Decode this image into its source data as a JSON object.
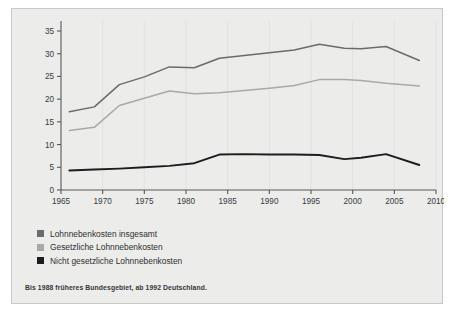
{
  "chart_data": {
    "type": "line",
    "title": "",
    "xlabel": "",
    "ylabel": "",
    "xlim": [
      1965,
      2010
    ],
    "ylim": [
      0,
      35
    ],
    "xticks": [
      1965,
      1970,
      1975,
      1980,
      1985,
      1990,
      1995,
      2000,
      2005,
      2010
    ],
    "yticks": [
      0,
      5,
      10,
      15,
      20,
      25,
      30,
      35
    ],
    "grid": "vertical-faint",
    "legend_position": "below-left",
    "series": [
      {
        "name": "Lohnnebenkosten insgesamt",
        "color": "#6b6b6d",
        "x": [
          1966,
          1969,
          1972,
          1975,
          1978,
          1981,
          1984,
          1987,
          1990,
          1993,
          1996,
          1999,
          2001,
          2004,
          2008
        ],
        "values": [
          17.2,
          18.3,
          23.2,
          24.9,
          27.1,
          26.9,
          29.0,
          29.6,
          30.2,
          30.8,
          32.1,
          31.2,
          31.1,
          31.6,
          28.5
        ]
      },
      {
        "name": "Gesetzliche Lohnnebenkosten",
        "color": "#a9a9a9",
        "x": [
          1966,
          1969,
          1972,
          1975,
          1978,
          1981,
          1984,
          1987,
          1990,
          1993,
          1996,
          1999,
          2001,
          2004,
          2008
        ],
        "values": [
          13.1,
          13.8,
          18.6,
          20.2,
          21.8,
          21.2,
          21.4,
          21.9,
          22.4,
          23.0,
          24.3,
          24.3,
          24.1,
          23.5,
          22.9
        ]
      },
      {
        "name": "Nicht gesetzliche Lohnnebenkosten",
        "color": "#1d1d1f",
        "x": [
          1966,
          1969,
          1972,
          1975,
          1978,
          1981,
          1984,
          1987,
          1990,
          1993,
          1996,
          1999,
          2001,
          2004,
          2008
        ],
        "values": [
          4.3,
          4.5,
          4.7,
          5.0,
          5.3,
          5.9,
          7.8,
          7.9,
          7.8,
          7.8,
          7.7,
          6.8,
          7.1,
          7.9,
          5.5
        ]
      }
    ]
  },
  "legend": {
    "items": [
      {
        "label": "Lohnnebenkosten insgesamt",
        "color": "#6b6b6d"
      },
      {
        "label": "Gesetzliche Lohnnebenkosten",
        "color": "#a9a9a9"
      },
      {
        "label": "Nicht gesetzliche Lohnnebenkosten",
        "color": "#1d1d1f"
      }
    ]
  },
  "footnote": {
    "text": "Bis 1988 früheres Bundesgebiet, ab 1992 Deutschland."
  }
}
